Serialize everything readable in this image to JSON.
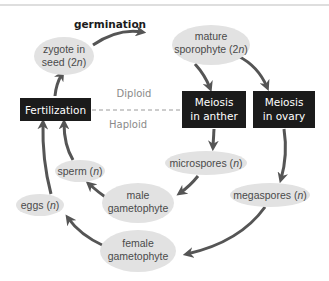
{
  "diagram": {
    "title_line_color": "#bdbdbd",
    "transition_label": "germination",
    "ploidy": {
      "upper": "Diploid",
      "lower": "Haploid"
    },
    "colors": {
      "ellipse_fill": "#e2e2e2",
      "box_fill": "#1b1b1b",
      "arrow": "#555555",
      "divider": "#9a9a9a"
    },
    "nodes": {
      "zygote": {
        "line1": "zygote in",
        "line2_prefix": "seed (2",
        "line2_italic": "n",
        "line2_suffix": ")"
      },
      "sporophyte": {
        "line1": "mature",
        "line2_prefix": "sporophyte (2",
        "line2_italic": "n",
        "line2_suffix": ")"
      },
      "fertilization": {
        "label": "Fertilization"
      },
      "meiosis_anther": {
        "line1": "Meiosis",
        "line2": "in anther"
      },
      "meiosis_ovary": {
        "line1": "Meiosis",
        "line2": "in ovary"
      },
      "microspores": {
        "prefix": "microspores (",
        "italic": "n",
        "suffix": ")"
      },
      "megaspores": {
        "prefix": "megaspores (",
        "italic": "n",
        "suffix": ")"
      },
      "sperm": {
        "prefix": "sperm (",
        "italic": "n",
        "suffix": ")"
      },
      "eggs": {
        "prefix": "eggs (",
        "italic": "n",
        "suffix": ")"
      },
      "male_gametophyte": {
        "line1": "male",
        "line2": "gametophyte"
      },
      "female_gametophyte": {
        "line1": "female",
        "line2": "gametophyte"
      }
    }
  }
}
